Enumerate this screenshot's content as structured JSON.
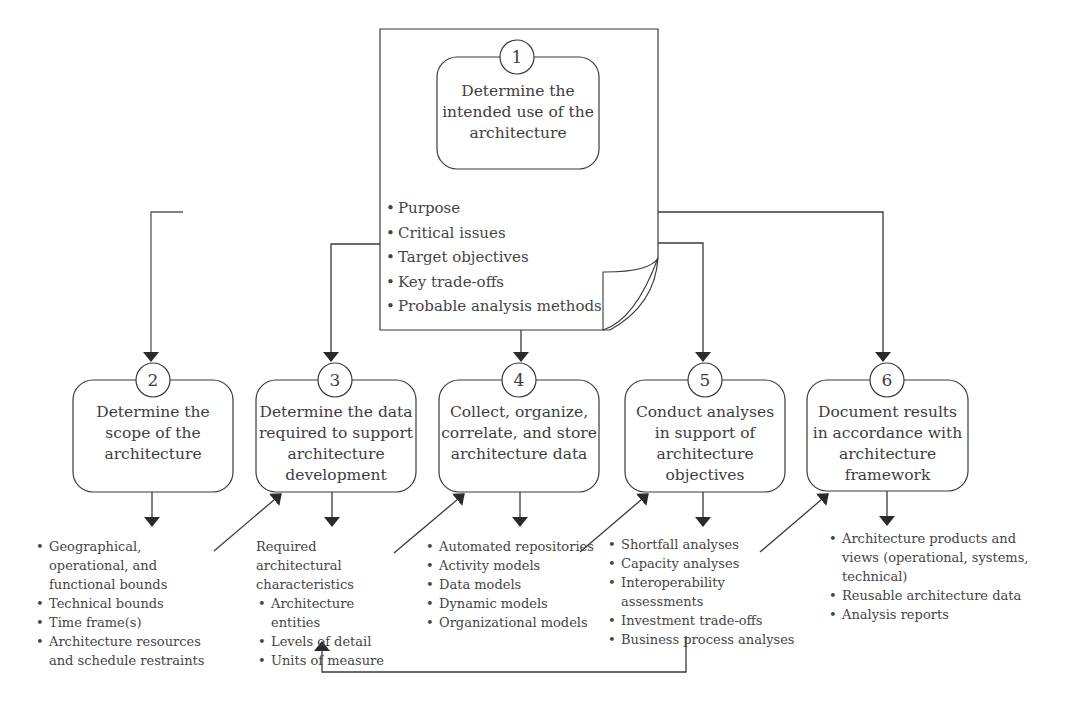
{
  "diagram": {
    "steps": [
      {
        "number": "1",
        "title": "Determine the intended use of the architecture",
        "title_lines": [
          "Determine the",
          "intended use of the",
          "architecture"
        ],
        "items": [
          "Purpose",
          "Critical issues",
          "Target objectives",
          "Key trade-offs",
          "Probable analysis methods"
        ]
      },
      {
        "number": "2",
        "title_lines": [
          "Determine the",
          "scope of the",
          "architecture"
        ],
        "items": [
          "Geographical, operational, and functional bounds",
          "Technical bounds",
          "Time frame(s)",
          "Architecture resources and schedule restraints"
        ]
      },
      {
        "number": "3",
        "title_lines": [
          "Determine the data",
          "required to support",
          "architecture",
          "development"
        ],
        "intro": "Required architectural characteristics",
        "items": [
          "Architecture entities",
          "Levels of detail",
          "Units of measure"
        ]
      },
      {
        "number": "4",
        "title_lines": [
          "Collect, organize,",
          "correlate, and store",
          "architecture data"
        ],
        "items": [
          "Automated repositories",
          "Activity models",
          "Data models",
          "Dynamic models",
          "Organizational models"
        ]
      },
      {
        "number": "5",
        "title_lines": [
          "Conduct analyses",
          "in support of",
          "architecture",
          "objectives"
        ],
        "items": [
          "Shortfall analyses",
          "Capacity analyses",
          "Interoperability assessments",
          "Investment trade-offs",
          "Business process analyses"
        ]
      },
      {
        "number": "6",
        "title_lines": [
          "Document results",
          "in accordance with",
          "architecture",
          "framework"
        ],
        "items": [
          "Architecture products and views (operational, systems, technical)",
          "Reusable architecture data",
          "Analysis reports"
        ]
      }
    ],
    "connections": [
      {
        "from": "1",
        "to": "2"
      },
      {
        "from": "1",
        "to": "3"
      },
      {
        "from": "1",
        "to": "4"
      },
      {
        "from": "1",
        "to": "5"
      },
      {
        "from": "1",
        "to": "6"
      },
      {
        "from": "2-details",
        "to": "3"
      },
      {
        "from": "3-details",
        "to": "4"
      },
      {
        "from": "4-details",
        "to": "5"
      },
      {
        "from": "5-details",
        "to": "6"
      },
      {
        "from": "5-details",
        "to": "3-details"
      }
    ],
    "colors": {
      "stroke": "#3a3a3a",
      "text": "#3d3d3d",
      "background": "#ffffff"
    }
  }
}
